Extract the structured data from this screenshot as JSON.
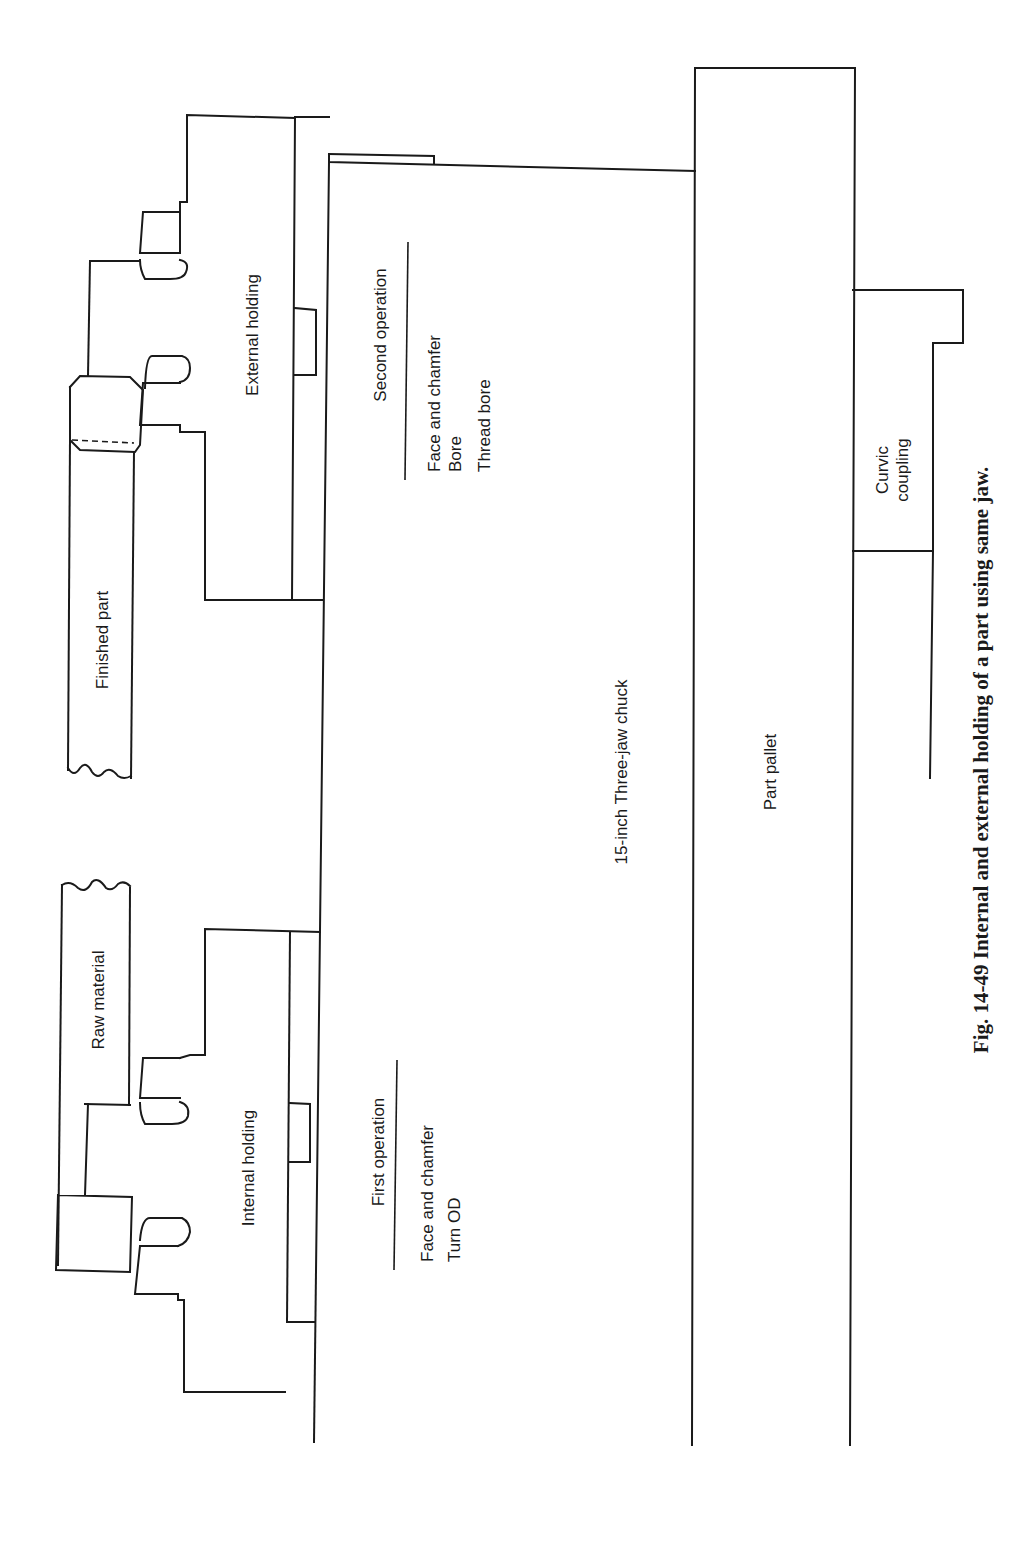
{
  "figure": {
    "caption": "Fig. 14-49  Internal and external holding of a part using same jaw.",
    "labels": {
      "finished_part": "Finished part",
      "raw_material": "Raw material",
      "external_holding": "External holding",
      "internal_holding": "Internal holding",
      "chuck": "15-inch Three-jaw chuck",
      "part_pallet": "Part pallet",
      "curvic_line1": "Curvic",
      "curvic_line2": "coupling"
    },
    "second_operation": {
      "title": "Second operation",
      "steps": [
        "Face and chamfer",
        "Bore",
        "Thread bore"
      ]
    },
    "first_operation": {
      "title": "First operation",
      "steps": [
        "Face and chamfer",
        "Turn OD"
      ]
    }
  }
}
